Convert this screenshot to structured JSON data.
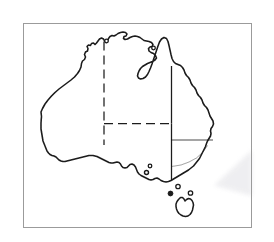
{
  "figure": {
    "background_color": "#ffffff",
    "page_tint": "#fdfdfd",
    "ink_color": "#1a1a1a",
    "frame_color": "#9b9b9b",
    "artifact_color": "#e9e9ec",
    "frame": {
      "name": "image-border",
      "x": 23,
      "y": 23,
      "width": 229,
      "height": 205,
      "stroke_width": 1
    },
    "viewbox": "0 0 274 242"
  },
  "geometry": {
    "mainland_coastline": "M 41.5 116.5 L 41.0 112.0 L 42.5 108.5 L 45.0 104.0 L 48.0 100.0 L 51.5 96.0 L 55.0 92.5 L 59.0 89.0 L 63.0 86.0 L 67.0 83.0 L 71.0 80.0 L 74.5 77.0 L 77.5 73.5 L 79.5 70.5 L 81.0 67.0 L 81.5 63.5 L 82.5 61.0 L 84.5 59.5 L 85.5 57.0 L 84.5 54.5 L 85.5 52.0 L 87.5 51.0 L 88.0 48.5 L 87.0 46.5 L 88.5 45.0 L 90.5 45.5 L 91.5 43.5 L 93.5 43.0 L 95.0 44.5 L 96.5 43.0 L 98.0 41.0 L 99.5 39.0 L 101.5 38.0 L 103.5 39.0 L 104.5 41.0 L 106.0 42.5 L 107.5 41.0 L 108.5 38.5 L 110.0 36.5 L 112.0 35.5 L 114.0 36.0 L 116.0 35.0 L 118.0 33.5 L 120.5 32.5 L 123.0 32.0 L 125.5 32.5 L 127.0 34.0 L 126.0 36.0 L 124.0 36.5 L 123.5 38.5 L 125.0 39.5 L 127.5 39.0 L 130.0 37.5 L 132.5 36.5 L 135.0 36.0 L 137.5 36.5 L 140.0 37.5 L 142.0 39.0 L 144.0 40.5 L 146.5 41.0 L 149.0 41.5 L 151.5 42.5 L 153.0 44.5 L 152.0 46.5 L 150.0 47.0 L 148.5 48.5 L 149.0 51.0 L 151.0 52.5 L 153.5 53.5 L 155.5 55.5 L 156.5 58.0 L 155.0 60.0 L 152.5 61.5 L 150.0 62.5 L 147.5 63.5 L 145.0 65.0 L 142.5 66.5 L 140.5 68.5 L 139.0 71.0 L 138.0 73.5 L 137.5 76.0 L 138.5 78.0 L 140.5 79.0 L 143.0 78.5 L 145.5 77.0 L 147.5 74.5 L 149.0 71.5 L 150.5 68.0 L 152.0 64.0 L 153.5 59.5 L 155.0 55.0 L 156.5 50.5 L 158.0 46.0 L 159.5 42.0 L 161.5 39.0 L 164.0 37.5 L 166.5 38.5 L 168.0 41.5 L 169.0 45.5 L 170.0 50.0 L 171.0 54.5 L 172.0 58.5 L 173.5 61.5 L 175.5 63.5 L 178.0 64.5 L 180.5 65.5 L 182.5 67.5 L 184.0 70.0 L 185.0 73.0 L 186.5 75.5 L 188.5 77.5 L 190.0 80.0 L 191.0 83.0 L 192.5 85.5 L 194.5 87.5 L 196.0 90.0 L 197.0 93.0 L 198.5 95.5 L 200.5 97.5 L 202.0 100.0 L 203.0 103.0 L 204.5 105.5 L 206.5 107.5 L 208.0 110.0 L 209.0 113.0 L 210.0 116.0 L 211.5 118.5 L 213.0 121.0 L 213.5 124.0 L 212.5 126.5 L 211.0 128.5 L 210.5 131.0 L 211.0 133.5 L 210.5 136.0 L 209.0 138.5 L 207.5 141.0 L 206.5 143.5 L 205.5 146.5 L 204.0 149.5 L 202.5 152.5 L 201.0 155.5 L 199.5 158.5 L 197.5 161.0 L 195.5 163.5 L 193.5 166.0 L 191.0 168.0 L 188.5 170.0 L 186.0 171.5 L 183.5 173.0 L 181.0 174.5 L 178.5 176.0 L 176.0 177.5 L 173.5 179.0 L 171.0 180.5 L 168.5 181.5 L 166.0 182.0 L 163.5 181.5 L 161.0 180.5 L 159.0 179.0 L 157.0 178.0 L 155.0 178.5 L 153.0 179.5 L 151.0 180.0 L 149.0 179.5 L 147.0 178.5 L 145.0 177.5 L 143.0 176.5 L 141.0 175.5 L 139.0 174.0 L 137.5 172.0 L 136.5 169.5 L 135.5 167.0 L 134.0 165.0 L 132.0 164.0 L 130.0 164.5 L 128.5 166.0 L 127.0 167.5 L 125.0 168.0 L 123.0 167.5 L 121.5 166.0 L 120.5 164.0 L 119.0 162.5 L 117.0 162.0 L 115.0 162.5 L 113.0 163.0 L 111.0 163.0 L 109.0 162.5 L 107.0 161.5 L 105.0 160.5 L 103.0 159.5 L 101.0 158.5 L 99.0 157.5 L 97.0 156.5 L 95.0 156.0 L 93.0 155.5 L 91.0 155.5 L 89.0 155.5 L 87.0 156.0 L 85.0 156.5 L 83.0 157.0 L 81.0 157.5 L 79.0 158.0 L 77.0 158.5 L 75.0 159.0 L 73.0 159.5 L 71.0 160.0 L 69.0 160.5 L 67.0 161.0 L 65.0 161.5 L 63.0 161.5 L 61.0 161.0 L 59.0 160.0 L 57.5 158.5 L 56.0 157.0 L 54.0 156.0 L 52.0 155.5 L 50.0 154.5 L 48.5 153.0 L 47.0 151.0 L 46.0 148.5 L 45.0 146.0 L 44.0 143.5 L 43.0 141.0 L 42.5 138.0 L 42.0 135.0 L 41.5 132.0 L 41.0 129.0 L 41.0 126.0 L 41.0 123.0 L 41.2 120.0 Z",
    "tasmania_coastline": "M 178.5 199.5 L 177.0 201.5 L 176.0 204.0 L 176.0 206.5 L 176.5 209.0 L 177.5 211.5 L 179.0 213.5 L 181.0 215.0 L 183.0 216.0 L 185.5 216.5 L 188.0 216.0 L 190.0 214.5 L 191.5 212.5 L 192.5 210.0 L 193.0 207.5 L 193.5 205.0 L 193.0 202.5 L 192.0 200.5 L 190.5 199.0 L 188.5 198.5 L 186.5 199.5 L 185.0 201.0 L 184.0 199.0 L 182.5 197.5 L 180.5 197.5 Z",
    "borders": [
      {
        "name": "wa-nt-sa-border",
        "type": "dashed-vertical",
        "d": "M 104.0 41.5 L 104.0 145.0",
        "dasharray": "9 5"
      },
      {
        "name": "nt-sa-border",
        "type": "dashed-horizontal",
        "d": "M 104.0 123.5 L 171.5 123.5",
        "dasharray": "9 5"
      },
      {
        "name": "nt-qld-border",
        "type": "solid-vertical",
        "d": "M 171.5 66.0 L 171.5 123.5",
        "dasharray": "none"
      },
      {
        "name": "sa-qld-nsw-border",
        "type": "solid-vertical",
        "d": "M 171.5 123.5 L 171.5 181.0",
        "dasharray": "none"
      },
      {
        "name": "qld-nsw-border",
        "type": "solid-horizontal",
        "d": "M 171.5 140.0 L 213.0 140.0",
        "dasharray": "none"
      },
      {
        "name": "nsw-vic-border",
        "type": "faint-diagonal",
        "d": "M 171.5 166.5 L 181.0 165.0 L 189.0 162.0 L 196.5 158.0 L 203.0 152.0 L 207.5 145.5",
        "dasharray": "none"
      }
    ],
    "locality_markers": [
      {
        "name": "marker-melbourne",
        "cx": 178.0,
        "cy": 186.5,
        "r": 2.2
      },
      {
        "name": "marker-bass-strait-west",
        "cx": 170.5,
        "cy": 193.5,
        "r": 2.4
      },
      {
        "name": "marker-tasmania-north",
        "cx": 190.5,
        "cy": 193.0,
        "r": 2.2
      },
      {
        "name": "marker-adelaide",
        "cx": 146.5,
        "cy": 172.5,
        "r": 2.0
      },
      {
        "name": "marker-spencer-gulf",
        "cx": 150.0,
        "cy": 166.0,
        "r": 1.8
      },
      {
        "name": "marker-darwin",
        "cx": 106.5,
        "cy": 41.0,
        "r": 1.8
      },
      {
        "name": "marker-perth",
        "cx": 41.0,
        "cy": 118.0,
        "r": 1.8
      },
      {
        "name": "marker-cape-york",
        "cx": 153.5,
        "cy": 48.0,
        "r": 1.8
      }
    ],
    "scan_artifact": {
      "name": "scan-smudge-artifact",
      "d": "M 252.0 150.0 L 214.0 185.5 L 252.0 196.0 Z"
    }
  }
}
